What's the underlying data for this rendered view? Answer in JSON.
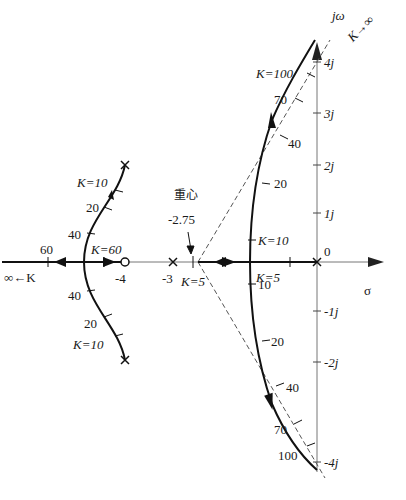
{
  "diagram": {
    "type": "root-locus",
    "axes": {
      "real_label": "σ",
      "imag_label": "jω",
      "origin_label": "0",
      "imag_ticks": [
        "4j",
        "3j",
        "2j",
        "1j",
        "-1j",
        "-2j",
        "-4j"
      ],
      "real_ticks": [
        "-4",
        "-3"
      ]
    },
    "centroid": {
      "label": "重心",
      "value": "-2.75"
    },
    "asymptote_label": "K→∞",
    "left_branch": {
      "infinity_label": "∞←K",
      "real_axis_gain": "60",
      "real_axis_gain_right": "K=60",
      "upper_labels": [
        "K=10",
        "20",
        "40"
      ],
      "lower_labels": [
        "40",
        "20",
        "K=10"
      ]
    },
    "right_branch": {
      "real_axis_gain": "K=5",
      "centroid_gain": "K=5",
      "upper_labels": [
        "K=100",
        "70",
        "40",
        "20",
        "K=10"
      ],
      "lower_labels": [
        "10",
        "20",
        "40",
        "70",
        "100"
      ]
    },
    "colors": {
      "locus": "#111111",
      "axis": "#666666",
      "asymptote": "#555555"
    }
  }
}
